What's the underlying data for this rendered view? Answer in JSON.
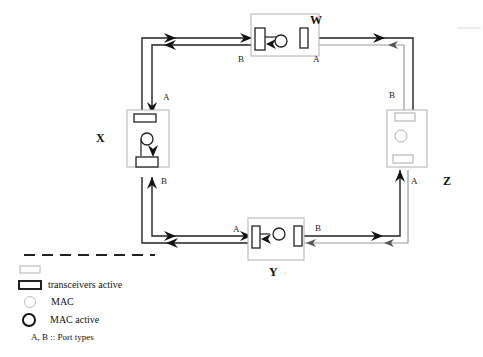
{
  "diagram": {
    "type": "dual-ring network topology",
    "nodes": [
      {
        "id": "W",
        "label": "W",
        "ports": {
          "left": "B",
          "right": "A"
        }
      },
      {
        "id": "X",
        "label": "X",
        "ports": {
          "top": "A",
          "bottom": "B"
        }
      },
      {
        "id": "Y",
        "label": "Y",
        "ports": {
          "left": "A",
          "right": "B"
        }
      },
      {
        "id": "Z",
        "label": "Z",
        "ports": {
          "top": "B",
          "bottom": "A"
        }
      }
    ],
    "port_labels": {
      "w_b": "B",
      "w_a": "A",
      "x_a": "A",
      "x_b": "B",
      "y_a": "A",
      "y_b": "B",
      "z_b": "B",
      "z_a": "A"
    },
    "edges": [
      {
        "from": "W",
        "to": "X",
        "via": "top-left corner"
      },
      {
        "from": "W",
        "to": "Z",
        "via": "top-right corner"
      },
      {
        "from": "X",
        "to": "Y",
        "via": "bottom-left corner"
      },
      {
        "from": "Y",
        "to": "Z",
        "via": "bottom-right corner"
      }
    ]
  },
  "legend": {
    "items": [
      {
        "symbol": "dashed-line",
        "label": ""
      },
      {
        "symbol": "transceiver-idle",
        "label": ""
      },
      {
        "symbol": "transceiver-active",
        "label": "transceivers active"
      },
      {
        "symbol": "mac-idle",
        "label": "MAC"
      },
      {
        "symbol": "mac-active",
        "label": "MAC active"
      },
      {
        "symbol": "none",
        "label": "A, B :: Port types"
      }
    ]
  },
  "colors": {
    "active": "#222222",
    "idle": "#a8a8a8",
    "background": "#ffffff"
  }
}
